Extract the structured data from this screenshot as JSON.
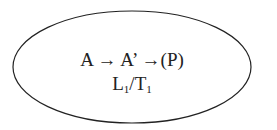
{
  "diagram": {
    "shape": "ellipse",
    "stroke_color": "#222222",
    "fill_color": "#ffffff",
    "line1": {
      "parts": [
        "A",
        "→",
        "A’",
        "→",
        "(P)"
      ],
      "text": "A → A’ →(P)"
    },
    "line2": {
      "L": "L",
      "L_sub": "1",
      "slash": "/",
      "T": "T",
      "T_sub": "1",
      "text": "L1/T1"
    }
  }
}
